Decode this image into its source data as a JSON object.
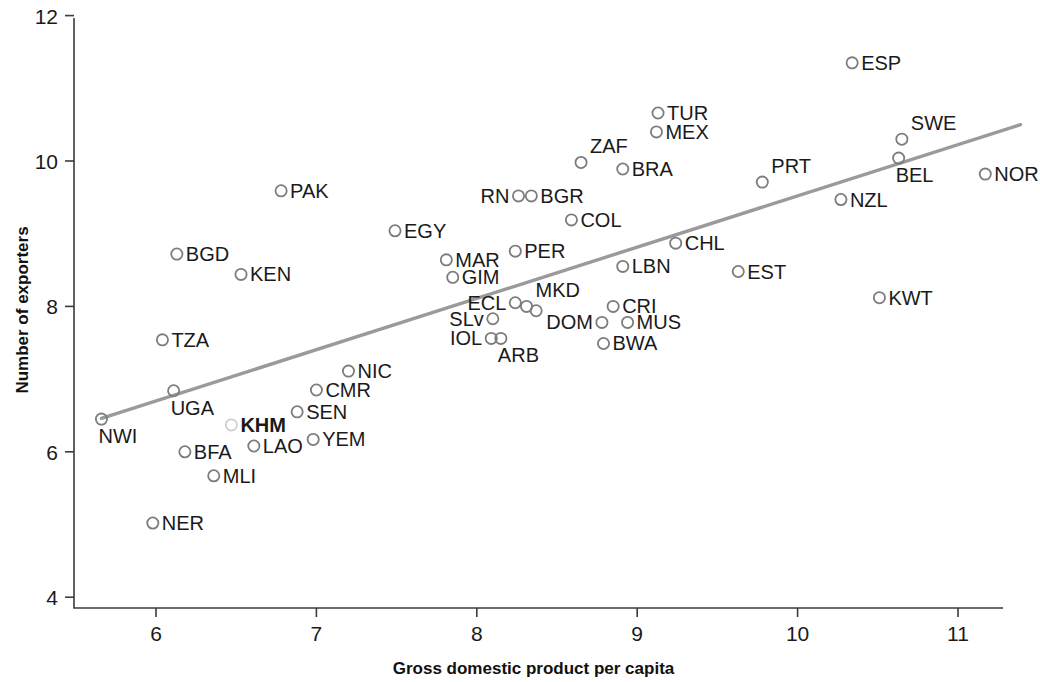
{
  "chart_data": {
    "type": "scatter",
    "title": "",
    "xlabel": "Gross domestic product per capita",
    "ylabel": "Number of exporters",
    "xlim": [
      5.55,
      11.3
    ],
    "ylim": [
      3.85,
      12.0
    ],
    "xticks": [
      6,
      7,
      8,
      9,
      10,
      11
    ],
    "xticklabels": [
      "6",
      "7",
      "8",
      "9",
      "10",
      "11"
    ],
    "yticks": [
      4,
      6,
      8,
      10,
      12
    ],
    "yticklabels": [
      "4",
      "6",
      "8",
      "10",
      "12"
    ],
    "grid": false,
    "legend": null,
    "point_label_color": "#1a1a1a",
    "marker_color": "#7d7d7d",
    "trendline_color": "#9a9a9a",
    "trendline": {
      "x1": 5.66,
      "y1": 6.46,
      "x2": 11.39,
      "y2": 10.5
    },
    "points": [
      {
        "label": "NWI",
        "x": 5.66,
        "y": 6.45,
        "label_pos": "below",
        "highlight": false
      },
      {
        "label": "NER",
        "x": 5.98,
        "y": 5.02,
        "label_pos": "right",
        "highlight": false
      },
      {
        "label": "UGA",
        "x": 6.11,
        "y": 6.84,
        "label_pos": "below",
        "highlight": false
      },
      {
        "label": "TZA",
        "x": 6.04,
        "y": 7.54,
        "label_pos": "right",
        "highlight": false
      },
      {
        "label": "BGD",
        "x": 6.13,
        "y": 8.72,
        "label_pos": "right",
        "highlight": false
      },
      {
        "label": "BFA",
        "x": 6.18,
        "y": 6.0,
        "label_pos": "right",
        "highlight": false
      },
      {
        "label": "MLI",
        "x": 6.36,
        "y": 5.67,
        "label_pos": "right",
        "highlight": false
      },
      {
        "label": "KHM",
        "x": 6.47,
        "y": 6.37,
        "label_pos": "right",
        "highlight": true
      },
      {
        "label": "KEN",
        "x": 6.53,
        "y": 8.44,
        "label_pos": "right",
        "highlight": false
      },
      {
        "label": "LAO",
        "x": 6.61,
        "y": 6.08,
        "label_pos": "right",
        "highlight": false
      },
      {
        "label": "SEN",
        "x": 6.88,
        "y": 6.55,
        "label_pos": "right",
        "highlight": false
      },
      {
        "label": "CMR",
        "x": 7.0,
        "y": 6.85,
        "label_pos": "right",
        "highlight": false
      },
      {
        "label": "YEM",
        "x": 6.98,
        "y": 6.17,
        "label_pos": "right",
        "highlight": false
      },
      {
        "label": "PAK",
        "x": 6.78,
        "y": 9.59,
        "label_pos": "right",
        "highlight": false
      },
      {
        "label": "NIC",
        "x": 7.2,
        "y": 7.11,
        "label_pos": "right",
        "highlight": false
      },
      {
        "label": "EGY",
        "x": 7.49,
        "y": 9.04,
        "label_pos": "right",
        "highlight": false
      },
      {
        "label": "MAR",
        "x": 7.81,
        "y": 8.64,
        "label_pos": "right",
        "highlight": false
      },
      {
        "label": "GIM",
        "x": 7.85,
        "y": 8.4,
        "label_pos": "right",
        "highlight": false
      },
      {
        "label": "SLv",
        "x": 8.1,
        "y": 7.83,
        "label_pos": "left",
        "highlight": false
      },
      {
        "label": "IOL",
        "x": 8.09,
        "y": 7.56,
        "label_pos": "left",
        "highlight": false
      },
      {
        "label": "ARB",
        "x": 8.15,
        "y": 7.56,
        "label_pos": "below",
        "highlight": false
      },
      {
        "label": "ECL",
        "x": 8.24,
        "y": 8.05,
        "label_pos": "left",
        "highlight": false
      },
      {
        "label": "MKD",
        "x": 8.31,
        "y": 8.0,
        "label_pos": "above",
        "highlight": false
      },
      {
        "label": "",
        "x": 8.37,
        "y": 7.94,
        "label_pos": "none",
        "highlight": false
      },
      {
        "label": "PER",
        "x": 8.24,
        "y": 8.76,
        "label_pos": "right",
        "highlight": false
      },
      {
        "label": "RN",
        "x": 8.26,
        "y": 9.52,
        "label_pos": "left",
        "highlight": false
      },
      {
        "label": "BGR",
        "x": 8.34,
        "y": 9.52,
        "label_pos": "right",
        "highlight": false
      },
      {
        "label": "COL",
        "x": 8.59,
        "y": 9.19,
        "label_pos": "right",
        "highlight": false
      },
      {
        "label": "ZAF",
        "x": 8.65,
        "y": 9.98,
        "label_pos": "above",
        "highlight": false
      },
      {
        "label": "CRI",
        "x": 8.85,
        "y": 8.0,
        "label_pos": "right",
        "highlight": false
      },
      {
        "label": "MUS",
        "x": 8.94,
        "y": 7.78,
        "label_pos": "right",
        "highlight": false
      },
      {
        "label": "DOM",
        "x": 8.78,
        "y": 7.78,
        "label_pos": "left",
        "highlight": false
      },
      {
        "label": "BWA",
        "x": 8.79,
        "y": 7.49,
        "label_pos": "right",
        "highlight": false
      },
      {
        "label": "LBN",
        "x": 8.91,
        "y": 8.55,
        "label_pos": "right",
        "highlight": false
      },
      {
        "label": "BRA",
        "x": 8.91,
        "y": 9.89,
        "label_pos": "right",
        "highlight": false
      },
      {
        "label": "TUR",
        "x": 9.13,
        "y": 10.66,
        "label_pos": "right",
        "highlight": false
      },
      {
        "label": "MEX",
        "x": 9.12,
        "y": 10.4,
        "label_pos": "right",
        "highlight": false
      },
      {
        "label": "CHL",
        "x": 9.24,
        "y": 8.87,
        "label_pos": "right",
        "highlight": false
      },
      {
        "label": "EST",
        "x": 9.63,
        "y": 8.48,
        "label_pos": "right",
        "highlight": false
      },
      {
        "label": "PRT",
        "x": 9.78,
        "y": 9.71,
        "label_pos": "above",
        "highlight": false
      },
      {
        "label": "NZL",
        "x": 10.27,
        "y": 9.47,
        "label_pos": "right",
        "highlight": false
      },
      {
        "label": "ESP",
        "x": 10.34,
        "y": 11.35,
        "label_pos": "right",
        "highlight": false
      },
      {
        "label": "KWT",
        "x": 10.51,
        "y": 8.12,
        "label_pos": "right",
        "highlight": false
      },
      {
        "label": "SWE",
        "x": 10.65,
        "y": 10.3,
        "label_pos": "above",
        "highlight": false
      },
      {
        "label": "BEL",
        "x": 10.63,
        "y": 10.04,
        "label_pos": "below",
        "highlight": false
      },
      {
        "label": "NOR",
        "x": 11.17,
        "y": 9.82,
        "label_pos": "right",
        "highlight": false
      }
    ]
  },
  "axes": {
    "x_title": "Gross domestic product per capita",
    "y_title": "Number of exporters"
  }
}
